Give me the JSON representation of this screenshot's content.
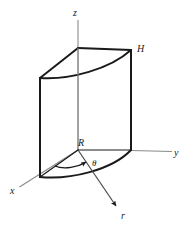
{
  "figure": {
    "background_color": "#ffffff",
    "solid_line_color": "#1a1a1a",
    "axis_line_color": "#6e6e6e",
    "labels": {
      "z_axis": "z",
      "y_axis": "y",
      "x_axis": "x",
      "r_axis": "r",
      "height": "H",
      "radius": "R",
      "angle": "θ"
    },
    "axes": [
      {
        "name": "z",
        "label": "z",
        "direction": "up"
      },
      {
        "name": "y",
        "label": "y",
        "direction": "right"
      },
      {
        "name": "x",
        "label": "x",
        "direction": "down-left"
      },
      {
        "name": "r",
        "label": "r",
        "direction": "down-right"
      }
    ],
    "annotations": [
      {
        "name": "height-label",
        "label": "H",
        "meaning": "cylinder height"
      },
      {
        "name": "radius-label",
        "label": "R",
        "meaning": "cylinder radius"
      },
      {
        "name": "angle-label",
        "label": "θ",
        "meaning": "azimuthal angle"
      }
    ]
  }
}
